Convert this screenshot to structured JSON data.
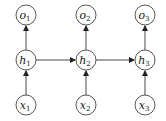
{
  "diagram": {
    "type": "recurrent neural network unrolled",
    "nodes": [
      {
        "id": "o1",
        "label": "o",
        "sub": "1",
        "x": 26,
        "y": 15
      },
      {
        "id": "o2",
        "label": "o",
        "sub": "2",
        "x": 86,
        "y": 15
      },
      {
        "id": "o3",
        "label": "o",
        "sub": "3",
        "x": 145,
        "y": 15
      },
      {
        "id": "h1",
        "label": "h",
        "sub": "1",
        "x": 26,
        "y": 60
      },
      {
        "id": "h2",
        "label": "h",
        "sub": "2",
        "x": 86,
        "y": 60
      },
      {
        "id": "h3",
        "label": "h",
        "sub": "3",
        "x": 145,
        "y": 60
      },
      {
        "id": "x1",
        "label": "x",
        "sub": "1",
        "x": 26,
        "y": 105
      },
      {
        "id": "x2",
        "label": "x",
        "sub": "2",
        "x": 86,
        "y": 105
      },
      {
        "id": "x3",
        "label": "x",
        "sub": "3",
        "x": 145,
        "y": 105
      }
    ],
    "edges": [
      {
        "from": "x1",
        "to": "h1"
      },
      {
        "from": "x2",
        "to": "h2"
      },
      {
        "from": "x3",
        "to": "h3"
      },
      {
        "from": "h1",
        "to": "o1"
      },
      {
        "from": "h2",
        "to": "o2"
      },
      {
        "from": "h3",
        "to": "o3"
      },
      {
        "from": "h1",
        "to": "h2"
      },
      {
        "from": "h2",
        "to": "h3"
      }
    ]
  }
}
